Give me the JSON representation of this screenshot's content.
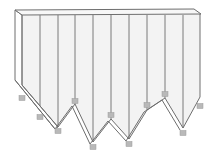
{
  "diagram": {
    "type": "folded-sheet-3d",
    "colors": {
      "face": "#f3f3f3",
      "edge": "#6e6e6e",
      "marker": "#b9b9b9"
    },
    "top_face": [
      [
        15,
        10
      ],
      [
        194,
        9
      ],
      [
        201,
        14
      ],
      [
        22,
        15
      ]
    ],
    "left_side": [
      [
        15,
        10
      ],
      [
        22,
        15
      ],
      [
        22,
        85
      ],
      [
        58,
        127
      ],
      [
        55,
        129
      ],
      [
        15,
        80
      ]
    ],
    "bottom_profile": [
      [
        22,
        85
      ],
      [
        58,
        127
      ],
      [
        75,
        104
      ],
      [
        93,
        142
      ],
      [
        111,
        119
      ],
      [
        129,
        139
      ],
      [
        147,
        110
      ],
      [
        165,
        98
      ],
      [
        183,
        128
      ],
      [
        200,
        97
      ],
      [
        200,
        14
      ]
    ],
    "bottom_profile_back": [
      [
        15,
        80
      ],
      [
        55,
        129
      ]
    ],
    "fold_lines_x": [
      40,
      58,
      75,
      93,
      111,
      129,
      147,
      165,
      183
    ],
    "markers": [
      {
        "x": 22,
        "y": 98
      },
      {
        "x": 40,
        "y": 117
      },
      {
        "x": 58,
        "y": 131
      },
      {
        "x": 75,
        "y": 101
      },
      {
        "x": 93,
        "y": 147
      },
      {
        "x": 111,
        "y": 115
      },
      {
        "x": 129,
        "y": 144
      },
      {
        "x": 147,
        "y": 105
      },
      {
        "x": 165,
        "y": 94
      },
      {
        "x": 183,
        "y": 133
      },
      {
        "x": 200,
        "y": 106
      }
    ]
  }
}
